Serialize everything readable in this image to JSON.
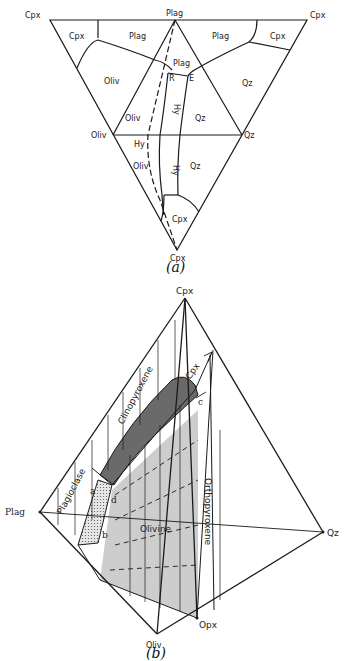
{
  "figure_a": {
    "caption": "(a)",
    "vertex_labels": {
      "top_left": "Cpx",
      "top_middle": "Plag",
      "top_right": "Cpx",
      "left": "Oliv",
      "right": "Qz",
      "bottom": "Cpx"
    },
    "field_labels": {
      "cpx_upper_left": "Cpx",
      "plag_upper_left": "Plag",
      "plag_upper_right": "Plag",
      "cpx_upper_right": "Cpx",
      "oliv_left": "Oliv",
      "plag_center": "Plag",
      "qz_right": "Qz",
      "oliv_inner": "Oliv",
      "hy_vertical_upper": "Hy",
      "qz_inner": "Qz",
      "hy_lower": "Hy",
      "oliv_lower": "Oliv",
      "hy_vertical_lower": "Hy",
      "qz_lower": "Qz",
      "cpx_lower": "Cpx"
    },
    "point_labels": {
      "r": "R",
      "e": "E"
    }
  },
  "figure_b": {
    "caption": "(b)",
    "vertex_labels": {
      "top": "Cpx",
      "left": "Plag",
      "right": "Qz",
      "bottom": "Oliv",
      "bottom_right": "Opx"
    },
    "volume_labels": {
      "clinopyroxene": "Clinopyroxene",
      "plagioclase": "Plagioclase",
      "olivine": "Olivine",
      "orthopyroxene": "Orthopyroxene",
      "cpx_inner": "Cpx"
    },
    "point_labels": {
      "a": "a",
      "b": "b",
      "c": "c",
      "d": "d"
    }
  },
  "colors": {
    "line": "#1a1a1a",
    "shade_dark": "#6e6e6e",
    "shade_light": "#cfcfcf",
    "background": "#ffffff"
  }
}
